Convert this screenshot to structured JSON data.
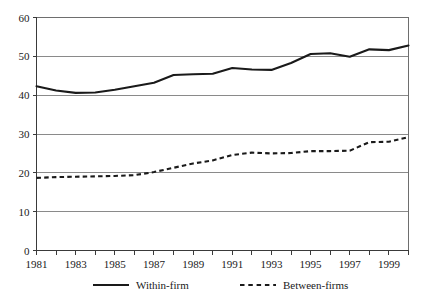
{
  "chart_data": {
    "type": "line",
    "title": "",
    "xlabel": "",
    "ylabel": "",
    "ylim": [
      0,
      60
    ],
    "xlim": [
      1981,
      2000
    ],
    "yticks": [
      0,
      10,
      20,
      30,
      40,
      50,
      60
    ],
    "ytick_labels": [
      "0",
      "10",
      "20",
      "30",
      "40",
      "50",
      "60"
    ],
    "x": [
      1981,
      1982,
      1983,
      1984,
      1985,
      1986,
      1987,
      1988,
      1989,
      1990,
      1991,
      1992,
      1993,
      1994,
      1995,
      1996,
      1997,
      1998,
      1999,
      2000
    ],
    "xtick_labels": [
      "1981",
      "",
      "1983",
      "",
      "1985",
      "",
      "1987",
      "",
      "1989",
      "",
      "1991",
      "",
      "1993",
      "",
      "1995",
      "",
      "1997",
      "",
      "1999",
      ""
    ],
    "xticks_all_years": true,
    "grid": true,
    "grid_axis": "y",
    "legend_position": "bottom",
    "series": [
      {
        "name": "Within-firm",
        "style": "solid",
        "color": "#1a1a1a",
        "values": [
          42.3,
          41.2,
          40.6,
          40.7,
          41.4,
          42.3,
          43.2,
          45.2,
          45.4,
          45.5,
          47.0,
          46.6,
          46.5,
          48.3,
          50.6,
          50.8,
          49.9,
          51.8,
          51.6,
          52.8
        ]
      },
      {
        "name": "Between-firms",
        "style": "dashed",
        "color": "#1a1a1a",
        "values": [
          18.7,
          18.9,
          19.0,
          19.1,
          19.2,
          19.4,
          20.2,
          21.3,
          22.4,
          23.2,
          24.6,
          25.2,
          25.0,
          25.1,
          25.6,
          25.6,
          25.7,
          27.9,
          28.0,
          29.2
        ]
      }
    ]
  },
  "legend": {
    "items": [
      {
        "label": "Within-firm",
        "style": "solid"
      },
      {
        "label": "Between-firms",
        "style": "dashed"
      }
    ]
  }
}
